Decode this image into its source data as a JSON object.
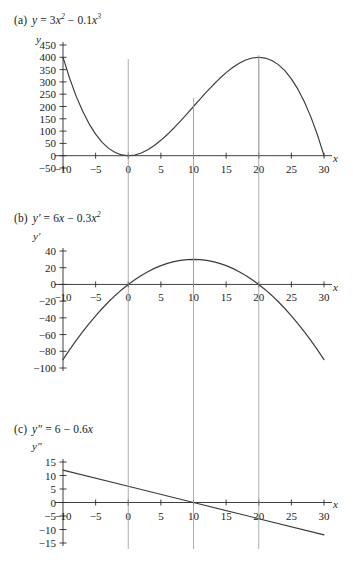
{
  "figure": {
    "background": "#ffffff",
    "ink": "#2a2a2a",
    "curve_color": "#3a3a3a",
    "gridline_color": "#9a9a9a",
    "panels": [
      "a",
      "b",
      "c"
    ]
  },
  "panel_a": {
    "tag": "(a)",
    "equation_plain": "y = 3x² − 0.1x³",
    "eq_lhs": "y",
    "eq_eq": "=",
    "eq_t1_coef": "3",
    "eq_t1_var": "x",
    "eq_t1_exp": "2",
    "eq_minus": "−",
    "eq_t2_coef": "0.1",
    "eq_t2_var": "x",
    "eq_t2_exp": "3",
    "y_axis_label": "y",
    "x_axis_label": "x"
  },
  "panel_b": {
    "tag": "(b)",
    "equation_plain": "y′ = 6x − 0.3x²",
    "eq_lhs": "y",
    "eq_lhs_prime": "′",
    "eq_eq": "=",
    "eq_t1_coef": "6",
    "eq_t1_var": "x",
    "eq_minus": "−",
    "eq_t2_coef": "0.3",
    "eq_t2_var": "x",
    "eq_t2_exp": "2",
    "y_axis_label": "y′",
    "x_axis_label": "x"
  },
  "panel_c": {
    "tag": "(c)",
    "equation_plain": "y″ = 6 − 0.6x",
    "eq_lhs": "y",
    "eq_lhs_prime": "″",
    "eq_eq": "=",
    "eq_t1_coef": "6",
    "eq_minus": "−",
    "eq_t2_coef": "0.6",
    "eq_t2_var": "x",
    "y_axis_label": "y″",
    "x_axis_label": "x"
  },
  "chart_data": [
    {
      "id": "panel-a",
      "type": "line",
      "title": "(a) y = 3x^2 - 0.1x^3",
      "xlabel": "x",
      "ylabel": "y",
      "xlim": [
        -10,
        30
      ],
      "ylim": [
        -50,
        450
      ],
      "xticks": [
        -10,
        -5,
        0,
        5,
        10,
        15,
        20,
        25,
        30
      ],
      "xticklabels": [
        "-10",
        "-5",
        "0",
        "5",
        "10",
        "15",
        "20",
        "25",
        "30"
      ],
      "yticks": [
        -50,
        0,
        50,
        100,
        150,
        200,
        250,
        300,
        350,
        400,
        450
      ],
      "yticklabels": [
        "-50",
        "0",
        "50",
        "100",
        "150",
        "200",
        "250",
        "300",
        "350",
        "400",
        "450"
      ],
      "grid": false,
      "vertical_guides": [
        0,
        10,
        20
      ],
      "legend": null,
      "series": [
        {
          "name": "y = 3x^2 - 0.1x^3",
          "x": [
            -10,
            -9,
            -8,
            -7,
            -6,
            -5,
            -4,
            -3,
            -2,
            -1,
            0,
            1,
            2,
            3,
            4,
            5,
            6,
            7,
            8,
            9,
            10,
            11,
            12,
            13,
            14,
            15,
            16,
            17,
            18,
            19,
            20,
            21,
            22,
            23,
            24,
            25,
            26,
            27,
            28,
            29,
            30
          ],
          "y": [
            400,
            315.9,
            243.2,
            181.3,
            129.6,
            87.5,
            54.4,
            29.7,
            12.8,
            3.1,
            0,
            2.9,
            11.2,
            24.3,
            41.6,
            62.5,
            86.4,
            112.7,
            140.8,
            170.1,
            200,
            229.9,
            259.2,
            287.3,
            313.6,
            337.5,
            358.4,
            375.7,
            389.2,
            397.1,
            400,
            396.9,
            387.2,
            370.3,
            345.6,
            312.5,
            270.4,
            218.7,
            156.8,
            84.1,
            0
          ]
        }
      ],
      "annotated_points": [
        {
          "x": 0,
          "y": 0
        },
        {
          "x": 10,
          "y": 200
        },
        {
          "x": 20,
          "y": 400
        }
      ]
    },
    {
      "id": "panel-b",
      "type": "line",
      "title": "(b) y' = 6x - 0.3x^2",
      "xlabel": "x",
      "ylabel": "y'",
      "xlim": [
        -10,
        30
      ],
      "ylim": [
        -100,
        40
      ],
      "xticks": [
        -10,
        -5,
        0,
        5,
        10,
        15,
        20,
        25,
        30
      ],
      "xticklabels": [
        "-10",
        "-5",
        "0",
        "5",
        "10",
        "15",
        "20",
        "25",
        "30"
      ],
      "yticks": [
        -100,
        -80,
        -60,
        -40,
        -20,
        0,
        20,
        40
      ],
      "yticklabels": [
        "-100",
        "-80",
        "-60",
        "-40",
        "-20",
        "0",
        "20",
        "40"
      ],
      "grid": false,
      "vertical_guides": [
        0,
        10,
        20
      ],
      "legend": null,
      "series": [
        {
          "name": "y' = 6x - 0.3x^2",
          "x": [
            -10,
            -9,
            -8,
            -7,
            -6,
            -5,
            -4,
            -3,
            -2,
            -1,
            0,
            1,
            2,
            3,
            4,
            5,
            6,
            7,
            8,
            9,
            10,
            11,
            12,
            13,
            14,
            15,
            16,
            17,
            18,
            19,
            20,
            21,
            22,
            23,
            24,
            25,
            26,
            27,
            28,
            29,
            30
          ],
          "y": [
            -90,
            -78.3,
            -67.2,
            -56.7,
            -46.8,
            -37.5,
            -28.8,
            -20.7,
            -13.2,
            -6.3,
            0,
            5.7,
            10.8,
            15.3,
            19.2,
            22.5,
            25.2,
            27.3,
            28.8,
            29.7,
            30,
            29.7,
            28.8,
            27.3,
            25.2,
            22.5,
            19.2,
            15.3,
            10.8,
            5.7,
            0,
            -6.3,
            -13.2,
            -20.7,
            -28.8,
            -37.5,
            -46.8,
            -56.7,
            -67.2,
            -78.3,
            -90
          ]
        }
      ],
      "annotated_points": [
        {
          "x": 0,
          "y": 0
        },
        {
          "x": 10,
          "y": 30
        },
        {
          "x": 20,
          "y": 0
        }
      ]
    },
    {
      "id": "panel-c",
      "type": "line",
      "title": "(c) y'' = 6 - 0.6x",
      "xlabel": "x",
      "ylabel": "y''",
      "xlim": [
        -10,
        30
      ],
      "ylim": [
        -15,
        15
      ],
      "xticks": [
        -10,
        -5,
        0,
        5,
        10,
        15,
        20,
        25,
        30
      ],
      "xticklabels": [
        "-10",
        "-5",
        "0",
        "5",
        "10",
        "15",
        "20",
        "25",
        "30"
      ],
      "yticks": [
        -15,
        -10,
        -5,
        0,
        5,
        10,
        15
      ],
      "yticklabels": [
        "-15",
        "-10",
        "-5",
        "0",
        "5",
        "10",
        "15"
      ],
      "grid": false,
      "vertical_guides": [
        0,
        10,
        20
      ],
      "legend": null,
      "series": [
        {
          "name": "y'' = 6 - 0.6x",
          "x": [
            -10,
            0,
            10,
            20,
            30
          ],
          "y": [
            12,
            6,
            0,
            -6,
            -12
          ]
        }
      ],
      "annotated_points": [
        {
          "x": 10,
          "y": 0
        }
      ]
    }
  ]
}
